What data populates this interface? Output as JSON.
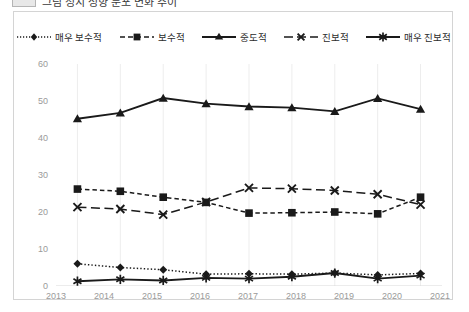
{
  "title_strip": {
    "text": "그림  정치 성향 분포 변화 추이",
    "swatch_name": "legend-swatch"
  },
  "legend": {
    "position": "top-center",
    "items": [
      {
        "label": "매우 보수적",
        "marker": "diamond",
        "line": "dotted"
      },
      {
        "label": "보수적",
        "marker": "square",
        "line": "dashed"
      },
      {
        "label": "중도적",
        "marker": "triangle",
        "line": "solid"
      },
      {
        "label": "진보적",
        "marker": "x",
        "line": "long-dash"
      },
      {
        "label": "매우 진보적",
        "marker": "asterisk",
        "line": "solid"
      }
    ]
  },
  "axes": {
    "y_ticks": [
      "0",
      "10",
      "20",
      "30",
      "40",
      "50",
      "60"
    ],
    "x_ticks": [
      "2013",
      "2014",
      "2015",
      "2016",
      "2017",
      "2018",
      "2019",
      "2020",
      "2021"
    ]
  },
  "colors": {
    "line": "#1a1a1a",
    "gridline": "#ededed",
    "frame": "#d4d4d4",
    "tick_text": "#9a9a9a",
    "legend_text": "#2b2b2b",
    "background": "#ffffff"
  },
  "chart_data": {
    "type": "line",
    "title": "그림  정치 성향 분포 변화 추이",
    "xlabel": "",
    "ylabel": "",
    "ylim": [
      0,
      60
    ],
    "grid": true,
    "legend_position": "top-center",
    "categories": [
      "2013",
      "2014",
      "2015",
      "2016",
      "2017",
      "2018",
      "2019",
      "2020",
      "2021"
    ],
    "series": [
      {
        "name": "매우 보수적",
        "marker": "diamond",
        "line": "dotted",
        "values": [
          6.0,
          5.0,
          4.4,
          3.2,
          3.3,
          3.2,
          3.5,
          3.0,
          3.4
        ]
      },
      {
        "name": "보수적",
        "marker": "square",
        "line": "dashed",
        "values": [
          26.2,
          25.6,
          24.0,
          22.6,
          19.7,
          19.8,
          20.0,
          19.5,
          24.0
        ]
      },
      {
        "name": "중도적",
        "marker": "triangle",
        "line": "solid",
        "values": [
          45.2,
          46.8,
          50.8,
          49.3,
          48.5,
          48.2,
          47.2,
          50.7,
          47.8
        ]
      },
      {
        "name": "진보적",
        "marker": "x",
        "line": "long-dash",
        "values": [
          21.3,
          20.8,
          19.3,
          22.7,
          26.5,
          26.3,
          25.8,
          24.8,
          22.0
        ]
      },
      {
        "name": "매우 진보적",
        "marker": "asterisk",
        "line": "solid",
        "values": [
          1.3,
          1.8,
          1.5,
          2.2,
          2.0,
          2.5,
          3.5,
          2.0,
          2.8
        ]
      }
    ]
  }
}
